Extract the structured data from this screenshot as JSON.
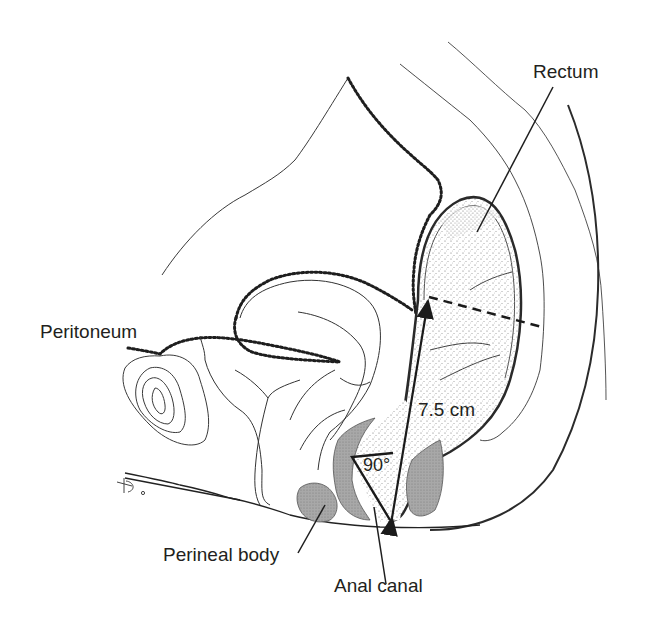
{
  "diagram": {
    "labels": {
      "rectum": "Rectum",
      "peritoneum": "Peritoneum",
      "perineal_body": "Perineal body",
      "anal_canal": "Anal canal",
      "distance": "7.5 cm",
      "angle": "90°"
    },
    "annotations": {
      "distance_arrow": "7.5 cm double-headed arrow from anal verge to peritoneal reflection",
      "anorectal_angle": "90°",
      "dashed_line": "Peritoneal reflection level across rectum"
    },
    "colors": {
      "ink": "#231f20",
      "stipple": "#8a8a8a",
      "muscle_fill": "#a9a9a9",
      "background": "#ffffff"
    }
  }
}
